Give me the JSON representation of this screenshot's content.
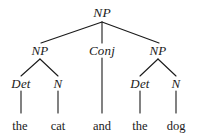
{
  "figure": {
    "kind": "syntax-tree",
    "sentence": "the cat and the dog",
    "ink_color": "#1a1a1a",
    "background_color": "#ffffff"
  },
  "nodes": {
    "root": {
      "label": "NP",
      "x": 102,
      "y": 13
    },
    "level2": [
      {
        "label": "NP",
        "x": 40,
        "y": 50
      },
      {
        "label": "Conj",
        "x": 102,
        "y": 50
      },
      {
        "label": "NP",
        "x": 158,
        "y": 50
      }
    ],
    "level3": [
      {
        "label": "Det",
        "x": 21,
        "y": 83
      },
      {
        "label": "N",
        "x": 58,
        "y": 83
      },
      {
        "label": "Det",
        "x": 140,
        "y": 83
      },
      {
        "label": "N",
        "x": 176,
        "y": 83
      }
    ],
    "words": [
      {
        "label": "the",
        "x": 20,
        "y": 126
      },
      {
        "label": "cat",
        "x": 58,
        "y": 126
      },
      {
        "label": "and",
        "x": 102,
        "y": 126
      },
      {
        "label": "the",
        "x": 140,
        "y": 126
      },
      {
        "label": "dog",
        "x": 176,
        "y": 126
      }
    ]
  },
  "edges": [
    {
      "from": "root-NP",
      "to": "NP-left",
      "x1": 102,
      "y1": 22,
      "x2": 41,
      "y2": 43
    },
    {
      "from": "root-NP",
      "to": "Conj",
      "x1": 102,
      "y1": 22,
      "x2": 102,
      "y2": 43
    },
    {
      "from": "root-NP",
      "to": "NP-right",
      "x1": 102,
      "y1": 22,
      "x2": 159,
      "y2": 43
    },
    {
      "from": "NP-left",
      "to": "Det-1",
      "x1": 40,
      "y1": 59,
      "x2": 21,
      "y2": 76
    },
    {
      "from": "NP-left",
      "to": "N-1",
      "x1": 40,
      "y1": 59,
      "x2": 58,
      "y2": 76
    },
    {
      "from": "NP-right",
      "to": "Det-2",
      "x1": 158,
      "y1": 59,
      "x2": 140,
      "y2": 76
    },
    {
      "from": "NP-right",
      "to": "N-2",
      "x1": 158,
      "y1": 59,
      "x2": 176,
      "y2": 76
    },
    {
      "from": "Det-1",
      "to": "the-1",
      "x1": 21,
      "y1": 91,
      "x2": 21,
      "y2": 113
    },
    {
      "from": "N-1",
      "to": "cat",
      "x1": 58,
      "y1": 91,
      "x2": 58,
      "y2": 113
    },
    {
      "from": "Conj",
      "to": "and",
      "x1": 102,
      "y1": 58,
      "x2": 102,
      "y2": 113
    },
    {
      "from": "Det-2",
      "to": "the-2",
      "x1": 140,
      "y1": 91,
      "x2": 140,
      "y2": 113
    },
    {
      "from": "N-2",
      "to": "dog",
      "x1": 176,
      "y1": 91,
      "x2": 176,
      "y2": 113
    }
  ]
}
